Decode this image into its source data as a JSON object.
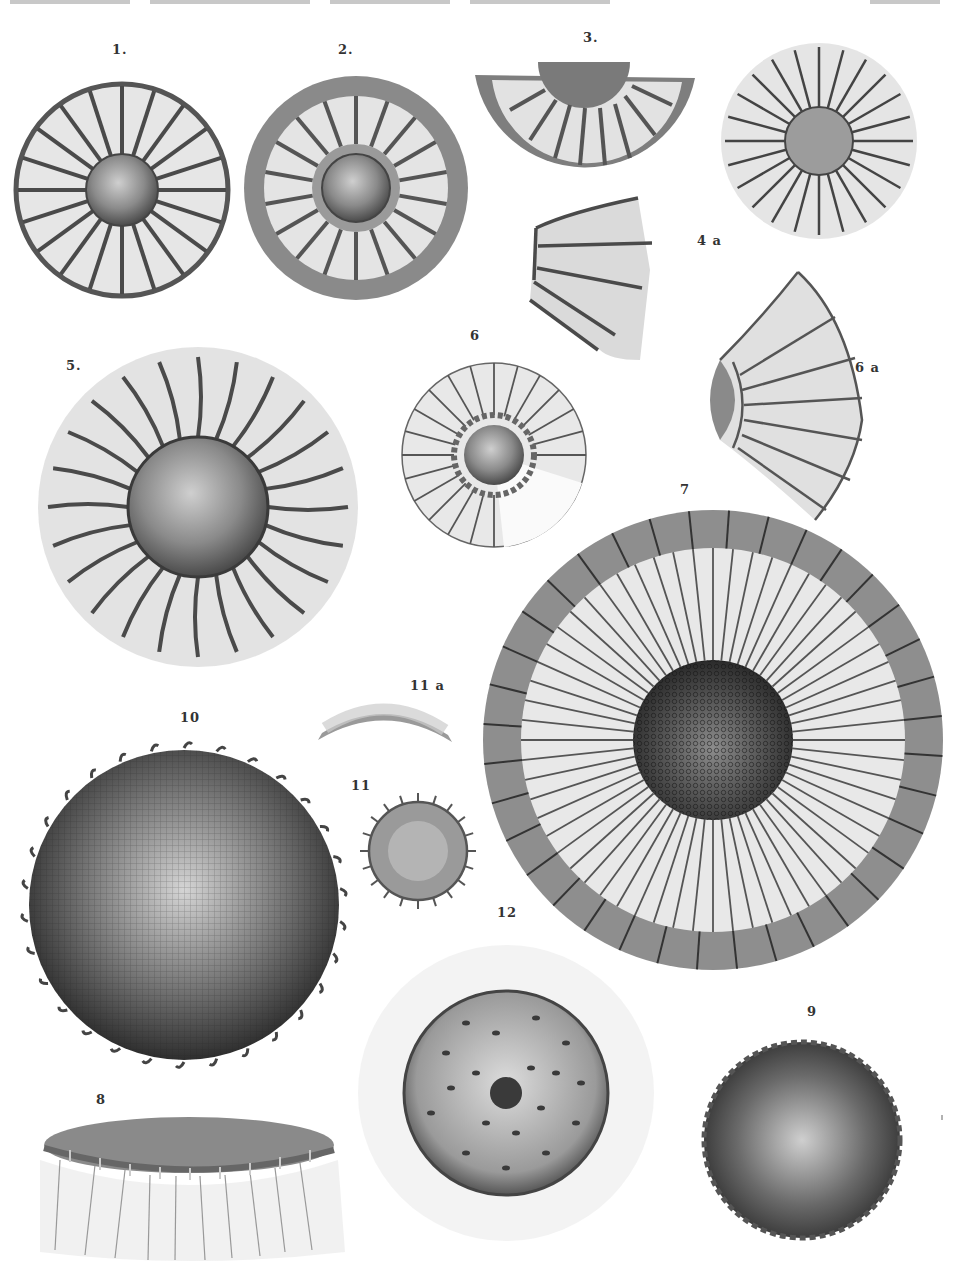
{
  "plate": {
    "header_text_cropped": true,
    "figure_labels": [
      {
        "id": "1",
        "text": "1.",
        "x": 112,
        "y": 42
      },
      {
        "id": "2",
        "text": "2.",
        "x": 338,
        "y": 42
      },
      {
        "id": "3",
        "text": "3.",
        "x": 583,
        "y": 30
      },
      {
        "id": "4a",
        "text": "4 a",
        "x": 697,
        "y": 233
      },
      {
        "id": "5",
        "text": "5.",
        "x": 66,
        "y": 358
      },
      {
        "id": "6",
        "text": "6",
        "x": 470,
        "y": 328
      },
      {
        "id": "6a",
        "text": "6 a",
        "x": 855,
        "y": 360
      },
      {
        "id": "7",
        "text": "7",
        "x": 680,
        "y": 482
      },
      {
        "id": "10",
        "text": "10",
        "x": 180,
        "y": 710
      },
      {
        "id": "11a",
        "text": "11 a",
        "x": 410,
        "y": 678
      },
      {
        "id": "11",
        "text": "11",
        "x": 351,
        "y": 778
      },
      {
        "id": "12",
        "text": "12",
        "x": 497,
        "y": 905
      },
      {
        "id": "8",
        "text": "8",
        "x": 96,
        "y": 1092
      },
      {
        "id": "9",
        "text": "9",
        "x": 807,
        "y": 1004
      }
    ]
  },
  "colors": {
    "ink": "#3a3a3a",
    "stipple_light": "#d8d8d8",
    "stipple_mid": "#a8a8a8",
    "stipple_dark": "#5a5a5a",
    "paper": "#ffffff"
  }
}
